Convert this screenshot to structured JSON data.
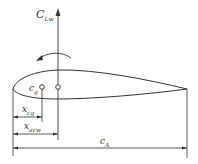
{
  "diagram": {
    "labels": {
      "lift": {
        "main": "C",
        "sub": "Lw"
      },
      "cg": {
        "main": "c",
        "sub": "g"
      },
      "x_cg": {
        "main": "x",
        "sub": "cg"
      },
      "x_acw": {
        "main": "x",
        "sub": "acw"
      },
      "chord": {
        "main": "c",
        "sub": "A"
      }
    },
    "colors": {
      "line": "#333333",
      "background": "#ffffff"
    }
  }
}
